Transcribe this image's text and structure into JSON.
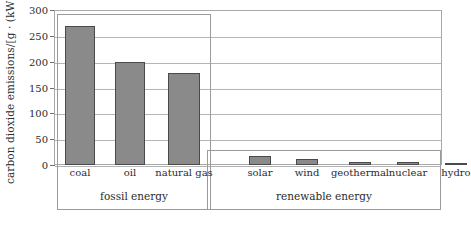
{
  "chart_data": {
    "type": "bar",
    "title": "",
    "xlabel": "",
    "ylabel": "carbon dioxide emissions/[g · (kW · h)⁻¹]",
    "ylabel_main": "carbon dioxide emissions/[g · (kW · h)",
    "ylabel_sup": "-1",
    "ylabel_tail": "]",
    "ylim": [
      0,
      300
    ],
    "ytick_values": [
      0,
      50,
      100,
      150,
      200,
      250,
      300
    ],
    "ytick_labels": [
      "0",
      "50",
      "100",
      "150",
      "200",
      "250",
      "300"
    ],
    "grid": "horizontal",
    "legend": "none",
    "categories": [
      "coal",
      "oil",
      "natural gas",
      "solar",
      "wind",
      "geothermal",
      "nuclear",
      "hydro"
    ],
    "values": [
      270,
      200,
      178,
      17,
      11,
      6,
      5,
      4
    ],
    "bars": [
      {
        "label": "coal",
        "value": 270,
        "group": "fossil energy"
      },
      {
        "label": "oil",
        "value": 200,
        "group": "fossil energy"
      },
      {
        "label": "natural gas",
        "value": 178,
        "group": "fossil energy"
      },
      {
        "label": "solar",
        "value": 17,
        "group": "renewable energy"
      },
      {
        "label": "wind",
        "value": 11,
        "group": "renewable energy"
      },
      {
        "label": "geothermal",
        "value": 6,
        "group": "renewable energy"
      },
      {
        "label": "nuclear",
        "value": 5,
        "group": "renewable energy"
      },
      {
        "label": "hydro",
        "value": 4,
        "group": "renewable energy"
      }
    ],
    "groups": [
      {
        "caption": "fossil energy",
        "members": [
          "coal",
          "oil",
          "natural gas"
        ]
      },
      {
        "caption": "renewable energy",
        "members": [
          "solar",
          "wind",
          "geothermal",
          "nuclear",
          "hydro"
        ]
      }
    ],
    "colors": {
      "bar_fill": "#8a8a8a",
      "bar_edge": "#4a4a4a",
      "grid": "#b4b4b4",
      "frame": "#a9a9a9",
      "text": "#2b2b2b",
      "background": "#ffffff"
    }
  }
}
